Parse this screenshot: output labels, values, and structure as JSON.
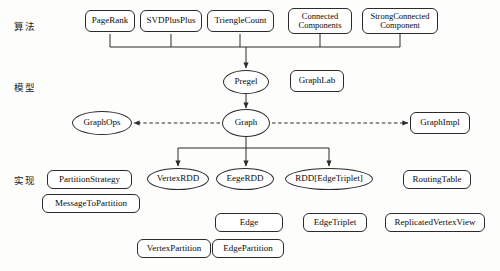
{
  "diagram": {
    "canvas": {
      "width": 500,
      "height": 271,
      "background": "#fdfdfc"
    },
    "stroke_color": "#2b2b2b",
    "text_color": "#0b0b0b",
    "layer_labels": [
      {
        "id": "layer-algorithm",
        "text": "算法",
        "x": 14,
        "y": 19
      },
      {
        "id": "layer-model",
        "text": "模型",
        "x": 14,
        "y": 80
      },
      {
        "id": "layer-implementation",
        "text": "实现",
        "x": 14,
        "y": 173
      }
    ],
    "nodes": [
      {
        "id": "pagerank",
        "label": "PageRank",
        "shape": "rect",
        "x": 85,
        "y": 10,
        "w": 50,
        "h": 22,
        "font": 9
      },
      {
        "id": "svdplusplus",
        "label": "SVDPlusPlus",
        "shape": "rect",
        "x": 140,
        "y": 10,
        "w": 62,
        "h": 22,
        "font": 9
      },
      {
        "id": "trienglecount",
        "label": "TriengleCount",
        "shape": "rect",
        "x": 207,
        "y": 10,
        "w": 67,
        "h": 22,
        "font": 9
      },
      {
        "id": "connectedcomponents",
        "label": "Connected\nComponents",
        "shape": "rect",
        "x": 288,
        "y": 8,
        "w": 64,
        "h": 26,
        "font": 8.5
      },
      {
        "id": "strongconnectedcomponent",
        "label": "StrongConnected\nComponent",
        "shape": "rect",
        "x": 362,
        "y": 8,
        "w": 76,
        "h": 26,
        "font": 8.5
      },
      {
        "id": "pregel",
        "label": "Pregel",
        "shape": "ellipse",
        "x": 223,
        "y": 70,
        "w": 46,
        "h": 24,
        "font": 9
      },
      {
        "id": "graphlab",
        "label": "GraphLab",
        "shape": "rect",
        "x": 290,
        "y": 70,
        "w": 54,
        "h": 22,
        "font": 9
      },
      {
        "id": "graphops",
        "label": "GraphOps",
        "shape": "ellipse",
        "x": 72,
        "y": 111,
        "w": 60,
        "h": 24,
        "font": 9
      },
      {
        "id": "graph",
        "label": "Graph",
        "shape": "ellipse",
        "x": 222,
        "y": 109,
        "w": 48,
        "h": 28,
        "font": 9
      },
      {
        "id": "graphimpl",
        "label": "GraphImpl",
        "shape": "rect",
        "x": 410,
        "y": 112,
        "w": 60,
        "h": 22,
        "font": 9
      },
      {
        "id": "partitionstrategy",
        "label": "PartitionStrategy",
        "shape": "rect",
        "x": 47,
        "y": 170,
        "w": 85,
        "h": 19,
        "font": 9
      },
      {
        "id": "messagetopartition",
        "label": "MessageToPartition",
        "shape": "rect",
        "x": 42,
        "y": 194,
        "w": 98,
        "h": 19,
        "font": 9
      },
      {
        "id": "vertexrdd",
        "label": "VertexRDD",
        "shape": "ellipse",
        "x": 147,
        "y": 168,
        "w": 62,
        "h": 22,
        "font": 9
      },
      {
        "id": "eegerdd",
        "label": "EegeRDD",
        "shape": "ellipse",
        "x": 216,
        "y": 168,
        "w": 58,
        "h": 22,
        "font": 9
      },
      {
        "id": "rddedgetriplet",
        "label": "RDD[EdgeTriplet]",
        "shape": "ellipse",
        "x": 285,
        "y": 168,
        "w": 88,
        "h": 22,
        "font": 9
      },
      {
        "id": "routingtable",
        "label": "RoutingTable",
        "shape": "rect",
        "x": 403,
        "y": 170,
        "w": 68,
        "h": 19,
        "font": 9
      },
      {
        "id": "edge",
        "label": "Edge",
        "shape": "rect",
        "x": 215,
        "y": 213,
        "w": 68,
        "h": 19,
        "font": 9
      },
      {
        "id": "edgetriplet",
        "label": "EdgeTriplet",
        "shape": "rect",
        "x": 303,
        "y": 213,
        "w": 64,
        "h": 19,
        "font": 9
      },
      {
        "id": "replicatedvertexview",
        "label": "ReplicatedVertexView",
        "shape": "rect",
        "x": 385,
        "y": 213,
        "w": 100,
        "h": 19,
        "font": 9
      },
      {
        "id": "vertexpartition",
        "label": "VertexPartition",
        "shape": "rect",
        "x": 137,
        "y": 239,
        "w": 74,
        "h": 19,
        "font": 9
      },
      {
        "id": "edgepartition",
        "label": "EdgePartition",
        "shape": "rect",
        "x": 212,
        "y": 239,
        "w": 72,
        "h": 19,
        "font": 9
      }
    ],
    "edges": [
      {
        "id": "bus-algorithms-to-pregel",
        "kind": "tree-bus",
        "style": "solid",
        "sources": [
          110,
          171,
          240,
          320,
          400
        ],
        "source_y": 34,
        "bus_y": 47,
        "target_x": 246,
        "target_y": 68,
        "arrow": true
      },
      {
        "id": "pregel-to-graph",
        "kind": "straight",
        "style": "solid",
        "x1": 246,
        "y1": 94,
        "x2": 246,
        "y2": 108,
        "arrow": true
      },
      {
        "id": "graph-to-graphops",
        "kind": "straight",
        "style": "dashed",
        "x1": 220,
        "y1": 123,
        "x2": 134,
        "y2": 123,
        "arrow": true
      },
      {
        "id": "graph-to-graphimpl",
        "kind": "straight",
        "style": "dashed",
        "x1": 272,
        "y1": 123,
        "x2": 408,
        "y2": 123,
        "arrow": true
      },
      {
        "id": "bus-graph-to-rdds",
        "kind": "fan-bus",
        "style": "solid",
        "source_x": 246,
        "source_y": 137,
        "bus_y": 148,
        "targets": [
          178,
          246,
          329
        ],
        "target_y": 166,
        "arrow": true
      }
    ]
  }
}
